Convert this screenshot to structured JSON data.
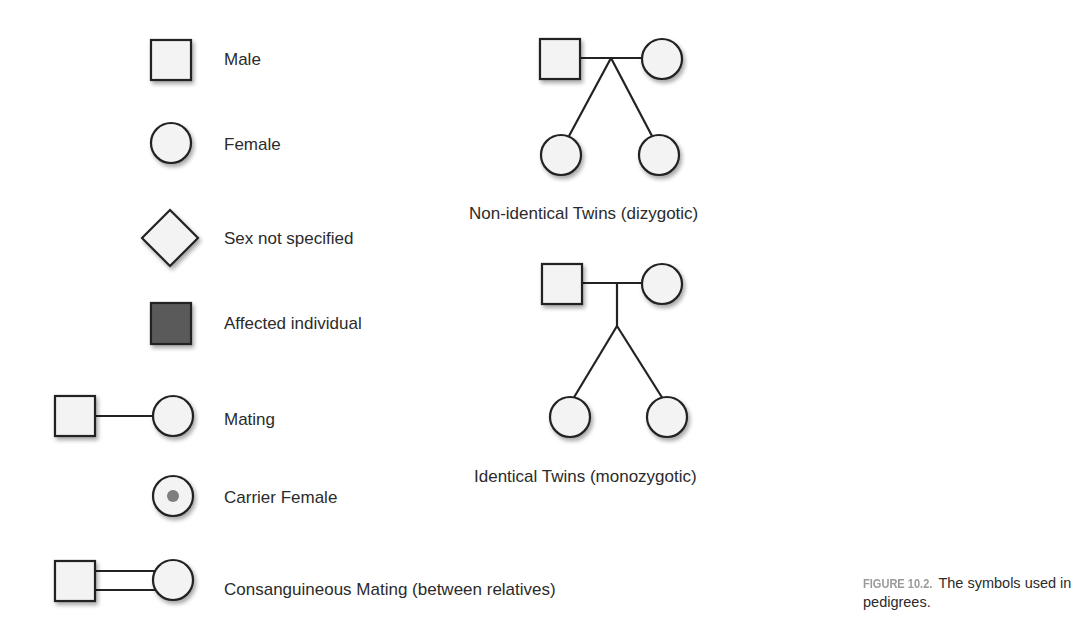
{
  "legend": {
    "items": [
      {
        "symbol": "square",
        "label": "Male"
      },
      {
        "symbol": "circle",
        "label": "Female"
      },
      {
        "symbol": "diamond",
        "label": "Sex not specified"
      },
      {
        "symbol": "filled-square",
        "label": "Affected individual"
      },
      {
        "symbol": "square-line-circle",
        "label": "Mating"
      },
      {
        "symbol": "circle-with-dot",
        "label": "Carrier Female"
      },
      {
        "symbol": "square-double-line-circle",
        "label": "Consanguineous Mating (between relatives)"
      }
    ]
  },
  "twins": {
    "dizygotic": {
      "label": "Non-identical Twins (dizygotic)"
    },
    "monozygotic": {
      "label": "Identical Twins (monozygotic)"
    }
  },
  "caption": {
    "figure_number": "FIGURE 10.2.",
    "text": "The symbols used in pedigrees."
  },
  "colors": {
    "stroke": "#222222",
    "fill": "#f3f3f3",
    "affected_fill": "#5a5a5a",
    "carrier_dot": "#7e7e7e",
    "caption_label": "#9a9a9a"
  }
}
